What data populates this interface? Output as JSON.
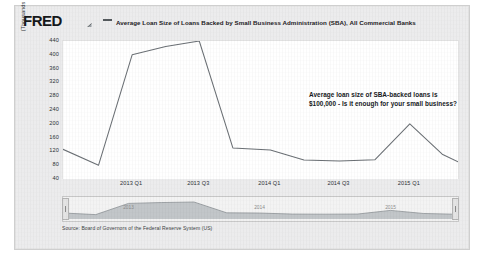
{
  "brand": {
    "logo_text": "FRED",
    "logo_mark": "chart-mark-icon"
  },
  "legend": {
    "series_label": "Average Loan Size of Loans Backed by Small Business Administration (SBA), All Commercial Banks",
    "line_color": "#555a5e"
  },
  "annotation": {
    "text": "Average loan size of SBA-backed loans is $100,000 - Is it enough for your small business?"
  },
  "source": {
    "text": "Source: Board of Governors of the Federal Reserve System (US)"
  },
  "minimap": {
    "labels": [
      "2013",
      "2014",
      "2015"
    ],
    "handle_left": "range-handle-left",
    "handle_right": "range-handle-right"
  },
  "chart_data": {
    "type": "line",
    "title": "Average Loan Size of Loans Backed by Small Business Administration (SBA), All Commercial Banks",
    "xlabel": "",
    "ylabel": "(Thousands of Dollars)",
    "ylim": [
      40,
      440
    ],
    "yticks": [
      440,
      400,
      360,
      320,
      280,
      240,
      200,
      160,
      120,
      80,
      40
    ],
    "xticks": [
      "2013 Q1",
      "2013 Q3",
      "2014 Q1",
      "2014 Q3",
      "2015 Q1"
    ],
    "xtick_positions": [
      0.175,
      0.345,
      0.525,
      0.7,
      0.878
    ],
    "grid": false,
    "legend_position": "top",
    "series": [
      {
        "name": "Average Loan Size of Loans Backed by SBA, All Commercial Banks",
        "color": "#6b7075",
        "x": [
          0.0,
          0.09,
          0.175,
          0.26,
          0.345,
          0.43,
          0.525,
          0.61,
          0.7,
          0.79,
          0.878,
          0.96,
          1.0
        ],
        "values": [
          126,
          80,
          400,
          424,
          440,
          130,
          124,
          95,
          92,
          96,
          200,
          112,
          90
        ]
      }
    ]
  }
}
